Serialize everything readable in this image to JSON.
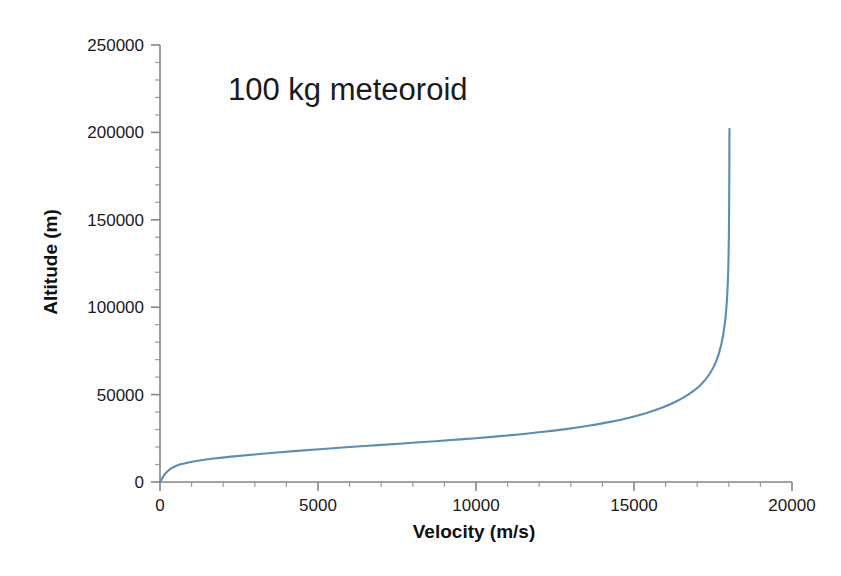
{
  "chart_data": {
    "type": "line",
    "title": "",
    "annotation": "100 kg meteoroid",
    "xlabel": "Velocity (m/s)",
    "ylabel": "Altitude (m)",
    "xlim": [
      0,
      20000
    ],
    "ylim": [
      0,
      250000
    ],
    "grid": false,
    "legend": false,
    "series_color": "#5B8DB8",
    "axis_color": "#868686",
    "x_major_ticks": [
      0,
      5000,
      10000,
      15000,
      20000
    ],
    "x_tick_labels": [
      "0",
      "5000",
      "10000",
      "15000",
      "20000"
    ],
    "x_minor_interval": 1000,
    "y_major_ticks": [
      0,
      50000,
      100000,
      150000,
      200000,
      250000
    ],
    "y_tick_labels": [
      "0",
      "50000",
      "100000",
      "150000",
      "200000",
      "250000"
    ],
    "y_minor_interval": 10000,
    "series": [
      {
        "name": "meteoroid trajectory",
        "x": [
          0,
          40,
          90,
          150,
          230,
          330,
          470,
          650,
          900,
          1250,
          1700,
          2250,
          2900,
          3600,
          4350,
          5150,
          6000,
          6900,
          7800,
          8700,
          9600,
          10500,
          11350,
          12150,
          12900,
          13600,
          14250,
          14850,
          15400,
          15900,
          16350,
          16750,
          17100,
          17380,
          17600,
          17760,
          17870,
          17940,
          17980,
          18000,
          18010,
          18015,
          18018,
          18020
        ],
        "y": [
          0,
          1200,
          2800,
          4400,
          6000,
          7500,
          8900,
          10100,
          11200,
          12300,
          13400,
          14500,
          15600,
          16700,
          17800,
          18900,
          20000,
          21100,
          22200,
          23300,
          24500,
          25800,
          27200,
          28700,
          30400,
          32300,
          34400,
          36800,
          39500,
          42600,
          46200,
          50400,
          55400,
          61500,
          69000,
          78500,
          90000,
          104000,
          120000,
          138000,
          156000,
          173000,
          189000,
          202000
        ]
      }
    ]
  },
  "annotations": {
    "label_100kg": "100 kg meteoroid"
  }
}
